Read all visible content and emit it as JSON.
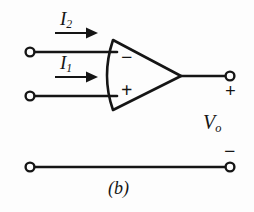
{
  "figure": {
    "caption": "(b)",
    "stroke_color": "#151515",
    "background_color": "#fdfdfd"
  },
  "labels": {
    "current_top_symbol": "I",
    "current_top_subscript": "2",
    "current_bottom_symbol": "I",
    "current_bottom_subscript": "1",
    "output_voltage_symbol": "V",
    "output_voltage_subscript": "o"
  },
  "signs": {
    "inverting_input": "−",
    "noninverting_input": "+",
    "output_positive": "+",
    "output_negative": "−"
  },
  "terminals": [
    {
      "name": "input-top-terminal",
      "x": 30,
      "y": 52
    },
    {
      "name": "input-bottom-terminal",
      "x": 30,
      "y": 96
    },
    {
      "name": "output-top-terminal",
      "x": 230,
      "y": 76
    },
    {
      "name": "output-bottom-terminal",
      "x": 230,
      "y": 167
    },
    {
      "name": "ground-left-terminal",
      "x": 30,
      "y": 167
    }
  ],
  "opamp": {
    "name": "operational-amplifier",
    "left_edge_top_x": 113,
    "left_edge_top_y": 40,
    "left_edge_bottom_x": 113,
    "left_edge_bottom_y": 110,
    "apex_x": 181,
    "apex_y": 76
  },
  "arrows": [
    {
      "name": "current-arrow-i2",
      "x1": 55,
      "y1": 33,
      "x2": 97,
      "y2": 33
    },
    {
      "name": "current-arrow-i1",
      "x1": 55,
      "y1": 77,
      "x2": 97,
      "y2": 77
    }
  ]
}
